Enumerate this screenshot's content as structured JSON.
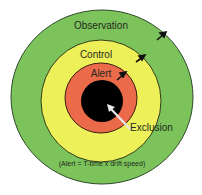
{
  "diagram": {
    "zones": [
      {
        "name": "Observation",
        "color": "#7dc35b"
      },
      {
        "name": "Control",
        "color": "#eef05a"
      },
      {
        "name": "Alert",
        "color": "#ea6a4a"
      },
      {
        "name": "Exclusion",
        "color": "#000000"
      }
    ],
    "labels": {
      "observation": "Observation",
      "control": "Control",
      "alert": "Alert",
      "exclusion": "Exclusion",
      "formula": "(Alert = T-time x drift speed)"
    }
  }
}
